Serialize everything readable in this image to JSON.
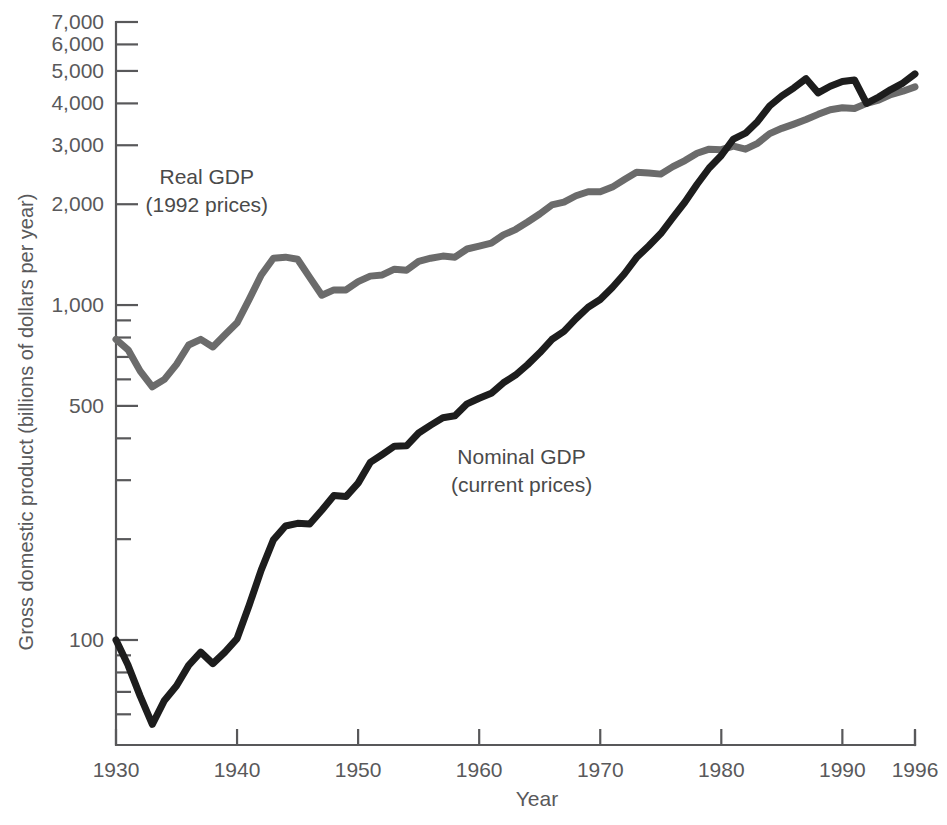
{
  "chart_data": {
    "type": "line",
    "title": "",
    "xlabel": "Year",
    "ylabel": "Gross domestic product (billions of dollars per year)",
    "yscale": "log",
    "ylim": [
      50,
      7800
    ],
    "xlim": [
      1930,
      1996
    ],
    "grid": false,
    "legend_position": "inline-annotations",
    "ytick_labels": [
      "7,000",
      "6,000",
      "5,000",
      "4,000",
      "3,000",
      "2,000",
      "1,000",
      "500",
      "100"
    ],
    "ytick_values": [
      7000,
      6000,
      5000,
      4000,
      3000,
      2000,
      1000,
      500,
      100
    ],
    "yminor_ticks": [
      900,
      800,
      700,
      600,
      400,
      300,
      200,
      90,
      80,
      70,
      60
    ],
    "xtick_labels": [
      "1930",
      "1940",
      "1950",
      "1960",
      "1970",
      "1980",
      "1990",
      "1996"
    ],
    "xtick_values": [
      1930,
      1940,
      1950,
      1960,
      1970,
      1980,
      1990,
      1996
    ],
    "annotations": [
      {
        "id": "real-gdp",
        "line1": "Real GDP",
        "line2": "(1992 prices)",
        "x": 1937.5,
        "y": 2300,
        "color": "#4a4a4a"
      },
      {
        "id": "nominal-gdp",
        "line1": "Nominal GDP",
        "line2": "(current prices)",
        "x": 1963.5,
        "y": 335,
        "color": "#222222"
      }
    ],
    "series": [
      {
        "name": "Real GDP (1992 prices)",
        "color": "#6b6b6b",
        "stroke_width": 7,
        "x": [
          1930,
          1931,
          1932,
          1933,
          1934,
          1935,
          1936,
          1937,
          1938,
          1939,
          1940,
          1941,
          1942,
          1943,
          1944,
          1945,
          1946,
          1947,
          1948,
          1949,
          1950,
          1951,
          1952,
          1953,
          1954,
          1955,
          1956,
          1957,
          1958,
          1959,
          1960,
          1961,
          1962,
          1963,
          1964,
          1965,
          1966,
          1967,
          1968,
          1969,
          1970,
          1971,
          1972,
          1973,
          1974,
          1975,
          1976,
          1977,
          1978,
          1979,
          1980,
          1981,
          1982,
          1983,
          1984,
          1985,
          1986,
          1987,
          1988,
          1989,
          1990,
          1991,
          1992,
          1993,
          1994,
          1995,
          1996
        ],
        "values": [
          790,
          735,
          635,
          570,
          600,
          665,
          760,
          790,
          750,
          815,
          885,
          1040,
          1230,
          1380,
          1390,
          1370,
          1210,
          1195,
          1240,
          1230,
          1345,
          1440,
          1490,
          1560,
          1545,
          1655,
          1690,
          1720,
          1705,
          1810,
          1855,
          1900,
          2015,
          2100,
          2220,
          2360,
          2515,
          2575,
          2695,
          2780,
          2780,
          2870,
          3025,
          3200,
          3185,
          3165,
          3340,
          3495,
          3685,
          3800,
          3785,
          3880,
          3800,
          3965,
          4255,
          4425,
          4565,
          4710,
          4905,
          5070,
          5140,
          5110,
          5190,
          5310,
          5530,
          5670,
          5860
        ],
        "display_values": [
          790,
          735,
          635,
          570,
          600,
          665,
          760,
          790,
          750,
          815,
          885,
          1040,
          1230,
          1380,
          1390,
          1370,
          1210,
          1070,
          1110,
          1110,
          1175,
          1220,
          1230,
          1280,
          1270,
          1350,
          1380,
          1400,
          1390,
          1470,
          1500,
          1530,
          1620,
          1680,
          1770,
          1870,
          1990,
          2030,
          2120,
          2180,
          2180,
          2250,
          2370,
          2490,
          2480,
          2460,
          2590,
          2700,
          2840,
          2920,
          2910,
          2980,
          2920,
          3040,
          3250,
          3370,
          3470,
          3580,
          3710,
          3830,
          3880,
          3860,
          4000,
          4090,
          4250,
          4350,
          4480
        ]
      },
      {
        "name": "Nominal GDP (current prices)",
        "color": "#1d1d1d",
        "stroke_width": 7,
        "x": [
          1930,
          1931,
          1932,
          1933,
          1934,
          1935,
          1936,
          1937,
          1938,
          1939,
          1940,
          1941,
          1942,
          1943,
          1944,
          1945,
          1946,
          1947,
          1948,
          1949,
          1950,
          1951,
          1952,
          1953,
          1954,
          1955,
          1956,
          1957,
          1958,
          1959,
          1960,
          1961,
          1962,
          1963,
          1964,
          1965,
          1966,
          1967,
          1968,
          1969,
          1970,
          1971,
          1972,
          1973,
          1974,
          1975,
          1976,
          1977,
          1978,
          1979,
          1980,
          1981,
          1982,
          1983,
          1984,
          1985,
          1986,
          1987,
          1988,
          1989,
          1990,
          1991,
          1992,
          1993,
          1994,
          1995,
          1996
        ],
        "values": [
          98,
          83,
          67,
          56,
          66,
          73,
          84,
          92,
          85,
          92,
          101,
          127,
          162,
          199,
          219,
          223,
          222,
          244,
          270,
          268,
          294,
          339,
          358,
          379,
          380,
          415,
          438,
          461,
          467,
          507,
          527,
          545,
          586,
          618,
          664,
          720,
          789,
          834,
          911,
          985,
          1039,
          1128,
          1240,
          1386,
          1501,
          1635,
          1824,
          2031,
          2295,
          2566,
          2796,
          3131,
          3259,
          3535,
          3933,
          4213,
          4453,
          4742,
          5109,
          5489,
          5803,
          5996,
          6338,
          6657,
          7072,
          7398,
          7813
        ],
        "display_values": [
          100,
          84,
          68,
          56,
          66,
          73,
          84,
          92,
          85,
          92,
          101,
          127,
          162,
          199,
          219,
          223,
          222,
          244,
          270,
          268,
          294,
          339,
          358,
          379,
          380,
          415,
          438,
          461,
          467,
          507,
          527,
          545,
          586,
          618,
          664,
          720,
          789,
          834,
          911,
          985,
          1039,
          1128,
          1240,
          1386,
          1501,
          1635,
          1824,
          2031,
          2295,
          2566,
          2796,
          3131,
          3259,
          3535,
          3933,
          4213,
          4453,
          4742,
          4300,
          4500,
          4650,
          4700,
          4000,
          4180,
          4400,
          4600,
          4900
        ]
      }
    ]
  },
  "axis": {
    "x_title": "Year",
    "y_title": "Gross domestic product (billions of dollars per year)"
  }
}
